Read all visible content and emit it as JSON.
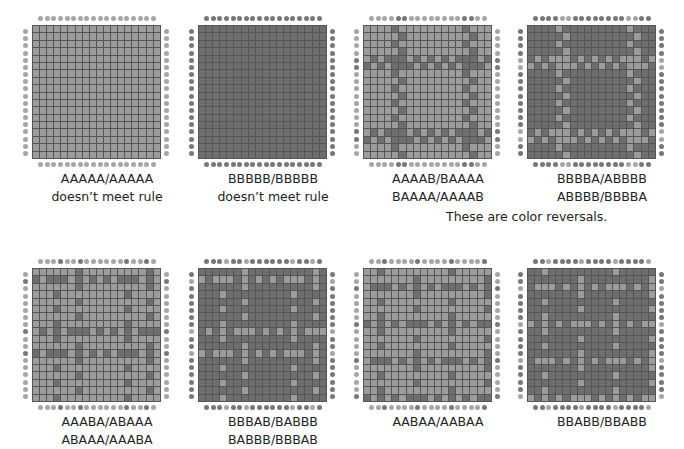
{
  "colors": {
    "A": "#9c9c9c",
    "B": "#6e6e6e",
    "dotA": "#a6a6a6",
    "dotB": "#777777",
    "grid_line": "#555555"
  },
  "grid_size": 18,
  "note": "These are color reversals.",
  "panels": [
    {
      "x": 32,
      "y": 25,
      "warp": "AAAAAAAAAA",
      "weft": "AAAAAAAAAA",
      "label1": "AAAAA/AAAAA",
      "label2": "doesn’t meet rule"
    },
    {
      "x": 198,
      "y": 25,
      "warp": "BBBBBBBBBB",
      "weft": "BBBBBBBBBB",
      "label1": "BBBBB/BBBBB",
      "label2": "doesn’t meet rule"
    },
    {
      "x": 363,
      "y": 25,
      "warp": "AAAABBAAAA",
      "weft": "AAAABBAAAA",
      "label1": "AAAAB/BAAAA",
      "label2": "BAAAA/AAAAB"
    },
    {
      "x": 527,
      "y": 25,
      "warp": "BBBBAABBBB",
      "weft": "BBBBAABBBB",
      "label1": "BBBBA/ABBBB",
      "label2": "ABBBB/BBBBA"
    },
    {
      "x": 32,
      "y": 268,
      "warp": "AAABAABAAA",
      "weft": "ABAAAAAABA",
      "label1": "AAABA/ABAAA",
      "label2": "ABAAA/AAABA"
    },
    {
      "x": 198,
      "y": 268,
      "warp": "BBBABBABBB",
      "weft": "BABBBBBBAB",
      "label1": "BBBAB/BABBB",
      "label2": "BABBB/BBBAB"
    },
    {
      "x": 363,
      "y": 268,
      "warp": "AABAAAABAA",
      "weft": "AABAAAABAA",
      "label1": "AABAA/AABAA",
      "label2": ""
    },
    {
      "x": 527,
      "y": 268,
      "warp": "BBABBBBABB",
      "weft": "BBABBBBABB",
      "label1": "BBABB/BBABB",
      "label2": ""
    }
  ]
}
